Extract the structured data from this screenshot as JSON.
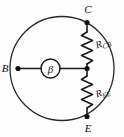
{
  "diagram": {
    "background_color": "#fdfdfd",
    "line_color": "#1a1a1a",
    "terminals": [
      {
        "id": "base",
        "label": "B",
        "position": "left"
      },
      {
        "id": "collector",
        "label": "C",
        "position": "top-right"
      },
      {
        "id": "emitter",
        "label": "E",
        "position": "bottom-right"
      }
    ],
    "source": {
      "symbol": "β",
      "shape": "circle",
      "name": "beta-current-source"
    },
    "resistors": [
      {
        "id": "r-cb",
        "symbol": "R",
        "subscript": "CB",
        "label": "R_CB",
        "between": "collector-node",
        "orientation": "vertical"
      },
      {
        "id": "r-ee",
        "symbol": "R",
        "subscript": "EE",
        "label": "R_EE",
        "between": "node-emitter",
        "orientation": "vertical"
      }
    ],
    "envelope": {
      "name": "device-outline",
      "shape": "circle"
    }
  }
}
